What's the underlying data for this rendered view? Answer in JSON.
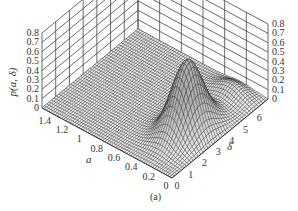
{
  "chart_data": {
    "type": "surface3d",
    "title": "",
    "caption": "(a)",
    "zlabel": "p(a, δ)",
    "xlabel": "a",
    "ylabel": "δ",
    "z_ticks": [
      "0",
      "0.1",
      "0.2",
      "0.3",
      "0.4",
      "0.5",
      "0.6",
      "0.7",
      "0.8"
    ],
    "a_ticks": [
      "1.4",
      "1.2",
      "1",
      "0.8",
      "0.6",
      "0.4",
      "0.2",
      "0"
    ],
    "delta_ticks": [
      "0",
      "1",
      "2",
      "3",
      "4",
      "5",
      "6"
    ],
    "zlim": [
      0,
      0.8
    ],
    "alim": [
      0,
      1.5
    ],
    "deltalim": [
      0,
      7
    ],
    "grid": true,
    "surface_description": "Probability density near zero for a > 0.5; single ridge/peak near a ≈ 0.3, δ ≈ 3 with max ≈ 0.75, decaying toward δ = 7 with a small shoulder near δ ≈ 6.",
    "peak": {
      "a": 0.3,
      "delta": 3.0,
      "value": 0.75
    }
  },
  "labels": {
    "zlabel": "p(a, δ)",
    "xlabel": "a",
    "ylabel": "δ",
    "caption": "(a)"
  }
}
